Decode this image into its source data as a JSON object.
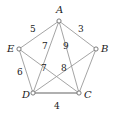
{
  "diagram": {
    "type": "weighted-graph",
    "title": "",
    "vertices": [
      {
        "id": "A",
        "label": "A",
        "x": 59,
        "y": 21
      },
      {
        "id": "B",
        "label": "B",
        "x": 96,
        "y": 49
      },
      {
        "id": "C",
        "label": "C",
        "x": 79,
        "y": 93
      },
      {
        "id": "D",
        "label": "D",
        "x": 33,
        "y": 93
      },
      {
        "id": "E",
        "label": "E",
        "x": 19,
        "y": 49
      }
    ],
    "edges": [
      {
        "from": "A",
        "to": "E",
        "weight": "5"
      },
      {
        "from": "A",
        "to": "B",
        "weight": "3"
      },
      {
        "from": "E",
        "to": "D",
        "weight": "6"
      },
      {
        "from": "D",
        "to": "C",
        "weight": "4"
      },
      {
        "from": "B",
        "to": "C",
        "weight": ""
      },
      {
        "from": "A",
        "to": "D",
        "weight": "7"
      },
      {
        "from": "A",
        "to": "C",
        "weight": "9"
      },
      {
        "from": "E",
        "to": "C",
        "weight": "7"
      },
      {
        "from": "D",
        "to": "B",
        "weight": "8"
      }
    ],
    "vertex_labels": {
      "A": "A",
      "B": "B",
      "C": "C",
      "D": "D",
      "E": "E"
    },
    "weight_labels": {
      "ae": "5",
      "ab": "3",
      "ed": "6",
      "dc": "4",
      "ad": "7",
      "ac": "9",
      "ec": "7",
      "db": "8"
    },
    "colors": {
      "edge": "#9a9a9a",
      "edge_highlight": "#b0b0b0",
      "vertex_stroke": "#6d6d6d",
      "vertex_fill": "#ffffff",
      "text": "#1a1a1a",
      "background": "#ffffff"
    }
  }
}
